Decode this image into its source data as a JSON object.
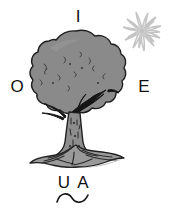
{
  "image": {
    "title": "Tree illustration with surrounding letters",
    "background_color": "#ffffff"
  },
  "letters": {
    "top": "I",
    "left": "O",
    "right": "E",
    "bottom_first": "U",
    "bottom_second": "A"
  },
  "figures": {
    "tree": {
      "name": "tree",
      "canopy_fill": "#8a8a8a",
      "canopy_shadow": "#6f6f6f",
      "trunk_fill": "#8a8a8a",
      "root_fill": "#9a9a9a",
      "outline_color": "#1c1c1c"
    },
    "sun": {
      "name": "sun",
      "ray_count": 16,
      "color": "#c9c9c9",
      "core_color": "#d8d8d8"
    },
    "wave": {
      "name": "tilde-wave",
      "color": "#1c1c1c"
    }
  }
}
